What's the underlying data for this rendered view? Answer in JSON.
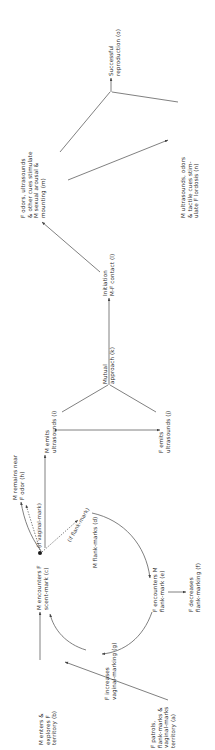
{
  "figure": {
    "type": "flow-diagram",
    "orientation": "rotated-90-ccw",
    "background_color": "#ffffff",
    "line_color": "#555555",
    "text_color": "#2b2b2b"
  },
  "nodes": {
    "a": {
      "id": "a",
      "label": "F patrols,\nflank-marks &\nvaginal-marks\nterritory (a)",
      "lines": [
        "F patrols,",
        "flank-marks &",
        "vaginal-marks",
        "territory (a)"
      ]
    },
    "b": {
      "id": "b",
      "label": "M enters &\nexplores F\nterritory (b)",
      "lines": [
        "M enters &",
        "explores F",
        "territory (b)"
      ]
    },
    "c": {
      "id": "c",
      "label": "M encounters F\nscent-mark (c)",
      "lines": [
        "M encounters F",
        "scent-mark (c)"
      ]
    },
    "d": {
      "id": "d",
      "label": "M flank-marks (d)",
      "lines": [
        "M flank-marks (d)"
      ]
    },
    "e": {
      "id": "e",
      "label": "F encounters M\nflank-mark (e)",
      "lines": [
        "F encounters M",
        "flank-mark (e)"
      ]
    },
    "f": {
      "id": "f",
      "label": "F decreases\nflank-marking (f)",
      "lines": [
        "F decreases",
        "flank-marking (f)"
      ]
    },
    "g": {
      "id": "g",
      "label": "F increases\nvaginal-marking (g)",
      "lines": [
        "F increases",
        "vaginal-marking (g)"
      ]
    },
    "h": {
      "id": "h",
      "label": "M remains near\nF odor (h)",
      "lines": [
        "M remains near",
        "F odor (h)"
      ]
    },
    "i": {
      "id": "i",
      "label": "M emits\nultrasounds (i)",
      "lines": [
        "M emits",
        "ultrasounds (i)"
      ]
    },
    "j": {
      "id": "j",
      "label": "F emits\nultrasounds (j)",
      "lines": [
        "F emits",
        "ultrasounds (j)"
      ]
    },
    "k": {
      "id": "k",
      "label": "Mutual\napproach (k)",
      "lines": [
        "Mutual",
        "approach (k)"
      ]
    },
    "l": {
      "id": "l",
      "label": "Initiation\nM-F contact (l)",
      "lines": [
        "Initiation",
        "M-F contact (l)"
      ]
    },
    "m": {
      "id": "m",
      "label": "F odors, ultrasounds\n& other cues stimulate\nM sexual arousal &\nmounting (m)",
      "lines": [
        "F odors, ultrasounds",
        "& other cues stimulate",
        "M sexual arousal &",
        "mounting (m)"
      ]
    },
    "n": {
      "id": "n",
      "label": "M ultrasounds, odors\n& tactile cues stim-\nulate F lordosis (n)",
      "lines": [
        "M ultrasounds, odors",
        "& tactile cues stim-",
        "ulate F lordosis (n)"
      ]
    },
    "o": {
      "id": "o",
      "label": "Successful\nreproduction (o)",
      "lines": [
        "Successful",
        "reproduction (o)"
      ]
    }
  },
  "conditions": {
    "vaginal_mark": "(if vaginal-mark)",
    "flank_mark": "(if flank-mark)"
  },
  "edges": [
    {
      "from": "a",
      "to": "b",
      "style": "solid"
    },
    {
      "from": "b",
      "to": "c",
      "style": "solid"
    },
    {
      "from": "c",
      "to": "d",
      "style": "dotted",
      "condition": "(if flank-mark)"
    },
    {
      "from": "c",
      "to": "h",
      "style": "dotted",
      "condition": "(if vaginal-mark)"
    },
    {
      "from": "d",
      "to": "e",
      "style": "curved"
    },
    {
      "from": "e",
      "to": "f",
      "style": "solid"
    },
    {
      "from": "e",
      "to": "g",
      "style": "curved"
    },
    {
      "from": "g",
      "to": "c",
      "style": "curved"
    },
    {
      "from": "h",
      "to": "i",
      "style": "solid"
    },
    {
      "from": "i",
      "to": "j",
      "style": "bidirectional"
    },
    {
      "from": "i",
      "to": "k",
      "style": "solid"
    },
    {
      "from": "j",
      "to": "k",
      "style": "solid"
    },
    {
      "from": "k",
      "to": "l",
      "style": "solid"
    },
    {
      "from": "l",
      "to": "m",
      "style": "solid"
    },
    {
      "from": "m",
      "to": "n",
      "style": "solid"
    },
    {
      "from": "m",
      "to": "o",
      "style": "solid"
    },
    {
      "from": "n",
      "to": "o",
      "style": "solid"
    }
  ]
}
